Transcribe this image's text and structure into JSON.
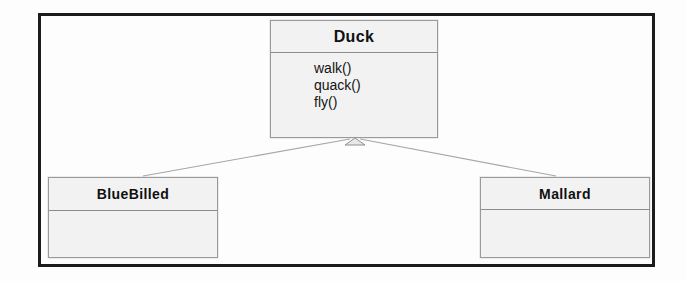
{
  "diagram": {
    "type": "uml-class-diagram",
    "notation": "generalization",
    "background_color": "#ffffff",
    "frame_color": "#1c1c1c",
    "box_fill_color": "#f2f2f2",
    "box_border_color": "#9a9a9a",
    "connector_color": "#9d9d9d"
  },
  "classes": {
    "superclass": {
      "name": "Duck",
      "operations": [
        "walk()",
        "quack()",
        "fly()"
      ]
    },
    "subclass_left": {
      "name": "BlueBilled",
      "operations": []
    },
    "subclass_right": {
      "name": "Mallard",
      "operations": []
    }
  },
  "relationships": [
    {
      "kind": "generalization",
      "from": "BlueBilled",
      "to": "Duck"
    },
    {
      "kind": "generalization",
      "from": "Mallard",
      "to": "Duck"
    }
  ]
}
